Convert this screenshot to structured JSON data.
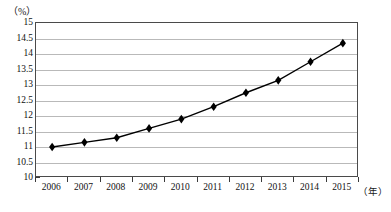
{
  "chart_data": {
    "type": "line",
    "title": "",
    "subtitle": "",
    "xlabel": "（年）",
    "ylabel": "（%）",
    "categories": [
      "2006",
      "2007",
      "2008",
      "2009",
      "2010",
      "2011",
      "2012",
      "2013",
      "2014",
      "2015"
    ],
    "values": [
      11.0,
      11.15,
      11.3,
      11.6,
      11.9,
      12.3,
      12.75,
      13.15,
      13.75,
      14.35
    ],
    "series": [
      {
        "name": "",
        "values": [
          11.0,
          11.15,
          11.3,
          11.6,
          11.9,
          12.3,
          12.75,
          13.15,
          13.75,
          14.35
        ]
      }
    ],
    "ylim": [
      10,
      15
    ],
    "ytick_labels": [
      "15",
      "14.5",
      "14",
      "13.5",
      "13",
      "12.5",
      "12",
      "11.5",
      "11",
      "10.5",
      "10"
    ],
    "ytick_values": [
      15,
      14.5,
      14,
      13.5,
      13,
      12.5,
      12,
      11.5,
      11,
      10.5,
      10
    ],
    "ytick_step": 0.5,
    "grid": true,
    "grid_axis": "y",
    "legend": false,
    "legend_position": "none",
    "marker": "diamond",
    "line_color": "#000000",
    "marker_color": "#000000",
    "grid_color": "#b9b9b9",
    "border_color": "#4a4a4a",
    "background": "#ffffff"
  }
}
